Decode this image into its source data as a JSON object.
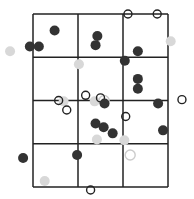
{
  "grid": {
    "cols": 3,
    "rows": 4,
    "x_range": [
      0,
      3
    ],
    "y_range": [
      0,
      4
    ],
    "line_color": "#222222"
  },
  "colors": {
    "dark": "#333333",
    "light": "#d8d8d8",
    "open_stroke": "#222222",
    "open_light_stroke": "#cccccc"
  },
  "points": {
    "dark": [
      [
        0.48,
        3.62
      ],
      [
        -0.07,
        3.25
      ],
      [
        0.13,
        3.25
      ],
      [
        1.43,
        3.49
      ],
      [
        1.39,
        3.28
      ],
      [
        2.33,
        3.14
      ],
      [
        2.04,
        2.92
      ],
      [
        2.33,
        2.5
      ],
      [
        2.33,
        2.27
      ],
      [
        1.59,
        1.93
      ],
      [
        2.78,
        1.93
      ],
      [
        1.39,
        1.47
      ],
      [
        1.57,
        1.38
      ],
      [
        1.77,
        1.24
      ],
      [
        2.89,
        1.31
      ],
      [
        -0.22,
        0.67
      ],
      [
        0.98,
        0.74
      ]
    ],
    "light": [
      [
        -0.51,
        3.14
      ],
      [
        1.02,
        2.84
      ],
      [
        3.06,
        3.37
      ],
      [
        0.68,
        1.98
      ],
      [
        1.37,
        1.98
      ],
      [
        1.42,
        1.1
      ],
      [
        0.26,
        0.14
      ],
      [
        2.03,
        1.08
      ]
    ],
    "open": [
      [
        2.11,
        4.0
      ],
      [
        2.76,
        4.0
      ],
      [
        0.57,
        2.0
      ],
      [
        0.75,
        1.78
      ],
      [
        1.17,
        2.12
      ],
      [
        1.5,
        2.06
      ],
      [
        2.06,
        1.63
      ],
      [
        3.31,
        2.02
      ],
      [
        1.28,
        -0.07
      ]
    ],
    "open_light": [
      [
        1.58,
        2.0
      ],
      [
        2.16,
        0.74
      ]
    ]
  }
}
